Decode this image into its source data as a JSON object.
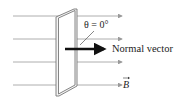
{
  "diagram": {
    "angle_label": "θ = 0°",
    "normal_label": "Normal vector",
    "field_label": "B",
    "field_vector_arrow": "→",
    "colors": {
      "field_lines": "#9a9a9a",
      "frame": "#777777",
      "normal_arrow": "#111111",
      "text": "#222222"
    }
  }
}
